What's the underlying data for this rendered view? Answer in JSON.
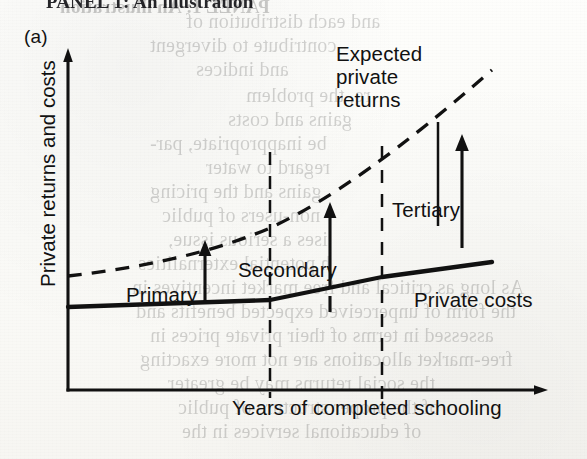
{
  "page": {
    "running_head": "PANEL 1: An illustration",
    "panel_label": "(a)"
  },
  "figure": {
    "y_axis_label": "Private returns and costs",
    "x_axis_label": "Years of completed schooling",
    "curves": [
      {
        "name": "expected-private-returns",
        "label": "Expected\nprivate\nreturns",
        "style": "dashed"
      },
      {
        "name": "private-costs",
        "label": "Private costs",
        "style": "solid"
      }
    ],
    "segments": [
      {
        "name": "primary",
        "label": "Primary"
      },
      {
        "name": "secondary",
        "label": "Secondary"
      },
      {
        "name": "tertiary",
        "label": "Tertiary"
      }
    ],
    "returns_label_lines": [
      "Expected",
      "private",
      "returns"
    ],
    "costs_label": "Private costs",
    "primary_label": "Primary",
    "secondary_label": "Secondary",
    "tertiary_label": "Tertiary"
  },
  "chart_data": {
    "type": "line",
    "title": "",
    "xlabel": "Years of completed schooling",
    "ylabel": "Private returns and costs",
    "grid": false,
    "legend": "inline-annotations",
    "xlim": [
      0,
      10
    ],
    "ylim": [
      0,
      10
    ],
    "axis_ticks": "none",
    "segment_boundaries": [
      4.0,
      6.6
    ],
    "segments": [
      "Primary",
      "Secondary",
      "Tertiary"
    ],
    "series": [
      {
        "name": "Expected private returns",
        "style": "dashed",
        "x": [
          0.0,
          1.0,
          2.0,
          3.0,
          4.0,
          5.0,
          6.0,
          6.6,
          7.5,
          8.5,
          8.9
        ],
        "y": [
          3.45,
          3.65,
          3.9,
          4.2,
          4.6,
          5.25,
          6.05,
          6.6,
          7.55,
          8.65,
          9.05
        ]
      },
      {
        "name": "Private costs",
        "style": "solid",
        "x": [
          0.0,
          1.0,
          2.0,
          3.0,
          4.0,
          5.0,
          6.0,
          6.6,
          7.5,
          8.5,
          9.0
        ],
        "y": [
          2.5,
          2.55,
          2.62,
          2.7,
          2.8,
          3.1,
          3.4,
          3.58,
          3.78,
          3.98,
          4.08
        ]
      }
    ],
    "gap_annotations": [
      {
        "segment": "Primary",
        "x": 3.0,
        "description": "arrow from costs up to returns"
      },
      {
        "segment": "Secondary",
        "x": 5.3,
        "description": "arrow from costs up to returns"
      },
      {
        "segment": "Tertiary",
        "x": 7.9,
        "description": "arrow from costs up to returns"
      }
    ]
  },
  "ghost_lines": [
    {
      "text": "and each distribution of",
      "x": 186,
      "y": 10,
      "size": 20
    },
    {
      "text": "contribute to divergent",
      "x": 150,
      "y": 34,
      "size": 20
    },
    {
      "text": "and indices",
      "x": 196,
      "y": 58,
      "size": 20
    },
    {
      "text": "re, the problem",
      "x": 246,
      "y": 84,
      "size": 20
    },
    {
      "text": "gains and costs",
      "x": 228,
      "y": 108,
      "size": 20
    },
    {
      "text": "be inappropriate, par-",
      "x": 150,
      "y": 132,
      "size": 20
    },
    {
      "text": "regard to water",
      "x": 206,
      "y": 156,
      "size": 20
    },
    {
      "text": "gains and the pricing",
      "x": 150,
      "y": 180,
      "size": 20
    },
    {
      "text": "non-users of public",
      "x": 162,
      "y": 204,
      "size": 20
    },
    {
      "text": "ises a serious issue,",
      "x": 168,
      "y": 228,
      "size": 20
    },
    {
      "text": "h potential externalities",
      "x": 138,
      "y": 252,
      "size": 20
    },
    {
      "text": "As long as critical and free market incentives in",
      "x": 132,
      "y": 276,
      "size": 20
    },
    {
      "text": "the form of unperceived expected benefits and",
      "x": 136,
      "y": 300,
      "size": 20
    },
    {
      "text": "assessed in terms of their private prices in",
      "x": 150,
      "y": 324,
      "size": 20
    },
    {
      "text": "free-market allocations are not more exacting",
      "x": 140,
      "y": 348,
      "size": 20
    },
    {
      "text": "the social returns may be greater",
      "x": 168,
      "y": 372,
      "size": 20
    },
    {
      "text": "of the proper structure of public",
      "x": 178,
      "y": 396,
      "size": 20
    },
    {
      "text": "of educational services in the",
      "x": 182,
      "y": 420,
      "size": 20
    },
    {
      "text": "PANEL 1: An illustration",
      "x": 60,
      "y": -4,
      "size": 19,
      "bold": true
    }
  ]
}
